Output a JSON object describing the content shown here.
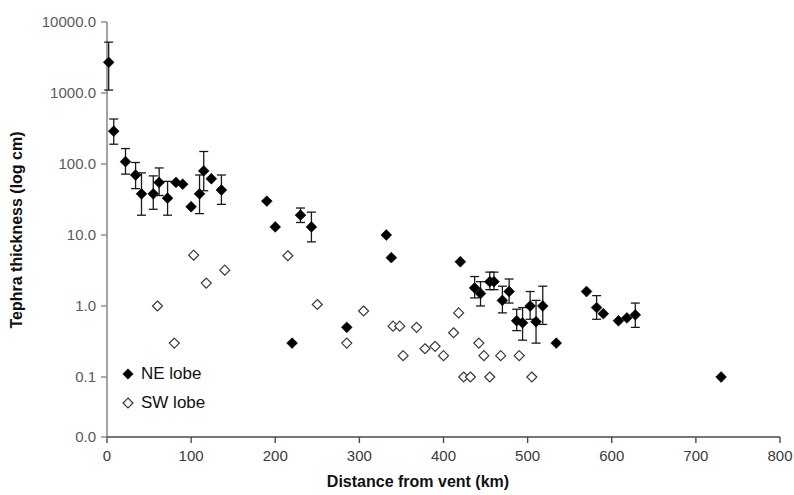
{
  "chart_data": {
    "type": "scatter",
    "title": "",
    "xlabel": "Distance from vent (km)",
    "ylabel": "Tephra thickness (log cm)",
    "xlim": [
      0,
      800
    ],
    "ylim": [
      0.01,
      10000
    ],
    "yscale": "log",
    "xticks": [
      0,
      100,
      200,
      300,
      400,
      500,
      600,
      700,
      800
    ],
    "xticklabels": [
      "0",
      "100",
      "200",
      "300",
      "400",
      "500",
      "600",
      "700",
      "800"
    ],
    "yticks": [
      10000,
      1000,
      100,
      10,
      1,
      0.1,
      0.01
    ],
    "yticklabels": [
      "10000.0",
      "1000.0",
      "100.0",
      "10.0",
      "1.0",
      "0.1",
      "0.0"
    ],
    "grid": false,
    "legend_position": "lower-left-inside",
    "series": [
      {
        "name": "NE lobe",
        "marker": "filled-diamond",
        "color": "#000000",
        "points": [
          {
            "x": 2,
            "y": 2700,
            "yerr_low": 1100,
            "yerr_high": 5200
          },
          {
            "x": 8,
            "y": 290,
            "yerr_low": 190,
            "yerr_high": 430
          },
          {
            "x": 22,
            "y": 108,
            "yerr_low": 72,
            "yerr_high": 165
          },
          {
            "x": 34,
            "y": 70,
            "yerr_low": 45,
            "yerr_high": 105
          },
          {
            "x": 41,
            "y": 38,
            "yerr_low": 19,
            "yerr_high": 75
          },
          {
            "x": 55,
            "y": 38,
            "yerr_low": 23,
            "yerr_high": 68
          },
          {
            "x": 62,
            "y": 55,
            "yerr_low": 36,
            "yerr_high": 88
          },
          {
            "x": 72,
            "y": 33,
            "yerr_low": 19,
            "yerr_high": 57
          },
          {
            "x": 82,
            "y": 55,
            "yerr_low": 55,
            "yerr_high": 55
          },
          {
            "x": 90,
            "y": 52,
            "yerr_low": 52,
            "yerr_high": 52
          },
          {
            "x": 100,
            "y": 25,
            "yerr_low": 25,
            "yerr_high": 25
          },
          {
            "x": 110,
            "y": 38,
            "yerr_low": 20,
            "yerr_high": 70
          },
          {
            "x": 115,
            "y": 80,
            "yerr_low": 42,
            "yerr_high": 150
          },
          {
            "x": 124,
            "y": 62,
            "yerr_low": 62,
            "yerr_high": 62
          },
          {
            "x": 136,
            "y": 43,
            "yerr_low": 27,
            "yerr_high": 70
          },
          {
            "x": 190,
            "y": 30,
            "yerr_low": 30,
            "yerr_high": 30
          },
          {
            "x": 200,
            "y": 13,
            "yerr_low": 13,
            "yerr_high": 13
          },
          {
            "x": 220,
            "y": 0.3,
            "yerr_low": 0.3,
            "yerr_high": 0.3
          },
          {
            "x": 230,
            "y": 19,
            "yerr_low": 15,
            "yerr_high": 24
          },
          {
            "x": 243,
            "y": 13,
            "yerr_low": 8,
            "yerr_high": 21
          },
          {
            "x": 285,
            "y": 0.5,
            "yerr_low": 0.5,
            "yerr_high": 0.5
          },
          {
            "x": 332,
            "y": 10,
            "yerr_low": 10,
            "yerr_high": 10
          },
          {
            "x": 338,
            "y": 4.8,
            "yerr_low": 4.8,
            "yerr_high": 4.8
          },
          {
            "x": 420,
            "y": 4.2,
            "yerr_low": 4.2,
            "yerr_high": 4.2
          },
          {
            "x": 437,
            "y": 1.8,
            "yerr_low": 1.3,
            "yerr_high": 2.6
          },
          {
            "x": 444,
            "y": 1.5,
            "yerr_low": 1.0,
            "yerr_high": 2.2
          },
          {
            "x": 455,
            "y": 2.2,
            "yerr_low": 1.7,
            "yerr_high": 3.0
          },
          {
            "x": 460,
            "y": 2.2,
            "yerr_low": 1.7,
            "yerr_high": 3.0
          },
          {
            "x": 470,
            "y": 1.2,
            "yerr_low": 0.8,
            "yerr_high": 1.9
          },
          {
            "x": 478,
            "y": 1.6,
            "yerr_low": 1.1,
            "yerr_high": 2.4
          },
          {
            "x": 487,
            "y": 0.62,
            "yerr_low": 0.45,
            "yerr_high": 0.9
          },
          {
            "x": 494,
            "y": 0.58,
            "yerr_low": 0.33,
            "yerr_high": 0.95
          },
          {
            "x": 503,
            "y": 1.0,
            "yerr_low": 0.65,
            "yerr_high": 1.6
          },
          {
            "x": 510,
            "y": 0.6,
            "yerr_low": 0.3,
            "yerr_high": 1.2
          },
          {
            "x": 518,
            "y": 1.0,
            "yerr_low": 0.55,
            "yerr_high": 1.9
          },
          {
            "x": 534,
            "y": 0.3,
            "yerr_low": 0.3,
            "yerr_high": 0.3
          },
          {
            "x": 570,
            "y": 1.6,
            "yerr_low": 1.6,
            "yerr_high": 1.6
          },
          {
            "x": 582,
            "y": 0.95,
            "yerr_low": 0.65,
            "yerr_high": 1.4
          },
          {
            "x": 590,
            "y": 0.78,
            "yerr_low": 0.78,
            "yerr_high": 0.78
          },
          {
            "x": 608,
            "y": 0.62,
            "yerr_low": 0.62,
            "yerr_high": 0.62
          },
          {
            "x": 618,
            "y": 0.68,
            "yerr_low": 0.68,
            "yerr_high": 0.68
          },
          {
            "x": 628,
            "y": 0.75,
            "yerr_low": 0.5,
            "yerr_high": 1.1
          },
          {
            "x": 730,
            "y": 0.1,
            "yerr_low": 0.1,
            "yerr_high": 0.1
          }
        ]
      },
      {
        "name": "SW lobe",
        "marker": "open-diamond",
        "color": "#ffffff",
        "points": [
          {
            "x": 60,
            "y": 1.0
          },
          {
            "x": 80,
            "y": 0.3
          },
          {
            "x": 103,
            "y": 5.2
          },
          {
            "x": 118,
            "y": 2.1
          },
          {
            "x": 140,
            "y": 3.2
          },
          {
            "x": 215,
            "y": 5.1
          },
          {
            "x": 250,
            "y": 1.05
          },
          {
            "x": 285,
            "y": 0.3
          },
          {
            "x": 305,
            "y": 0.85
          },
          {
            "x": 340,
            "y": 0.52
          },
          {
            "x": 348,
            "y": 0.52
          },
          {
            "x": 352,
            "y": 0.2
          },
          {
            "x": 368,
            "y": 0.5
          },
          {
            "x": 378,
            "y": 0.25
          },
          {
            "x": 390,
            "y": 0.27
          },
          {
            "x": 400,
            "y": 0.2
          },
          {
            "x": 412,
            "y": 0.42
          },
          {
            "x": 418,
            "y": 0.8
          },
          {
            "x": 424,
            "y": 0.1
          },
          {
            "x": 432,
            "y": 0.1
          },
          {
            "x": 442,
            "y": 0.3
          },
          {
            "x": 448,
            "y": 0.2
          },
          {
            "x": 455,
            "y": 0.1
          },
          {
            "x": 468,
            "y": 0.2
          },
          {
            "x": 490,
            "y": 0.2
          },
          {
            "x": 505,
            "y": 0.1
          }
        ]
      }
    ]
  }
}
